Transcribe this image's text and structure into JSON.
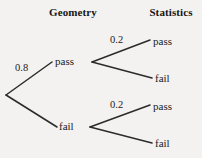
{
  "diagram": {
    "type": "probability-tree",
    "background_color": "#f3f2f0",
    "line_color": "#2b2b2b",
    "headers": [
      {
        "id": "geometry",
        "label": "Geometry"
      },
      {
        "id": "statistics",
        "label": "Statistics"
      }
    ],
    "nodes": {
      "geometry_pass": "pass",
      "geometry_fail": "fail",
      "stats_top_pass": "pass",
      "stats_top_fail": "fail",
      "stats_bottom_pass": "pass",
      "stats_bottom_fail": "fail"
    },
    "probabilities": {
      "root_to_pass": "0.8",
      "top_to_pass": "0.2",
      "bottom_to_pass": "0.2"
    },
    "branches": [
      {
        "id": "root-to-geometry-pass",
        "from": [
          6,
          95
        ],
        "to": [
          52,
          62
        ],
        "label": "0.8"
      },
      {
        "id": "root-to-geometry-fail",
        "from": [
          6,
          95
        ],
        "to": [
          57,
          127
        ],
        "label": ""
      },
      {
        "id": "geometry-pass-to-stats-pass",
        "from": [
          92,
          62
        ],
        "to": [
          150,
          40
        ],
        "label": "0.2"
      },
      {
        "id": "geometry-pass-to-stats-fail",
        "from": [
          92,
          62
        ],
        "to": [
          152,
          78
        ],
        "label": ""
      },
      {
        "id": "geometry-fail-to-stats-pass",
        "from": [
          90,
          127
        ],
        "to": [
          150,
          105
        ],
        "label": "0.2"
      },
      {
        "id": "geometry-fail-to-stats-fail",
        "from": [
          90,
          127
        ],
        "to": [
          152,
          143
        ],
        "label": ""
      }
    ]
  }
}
